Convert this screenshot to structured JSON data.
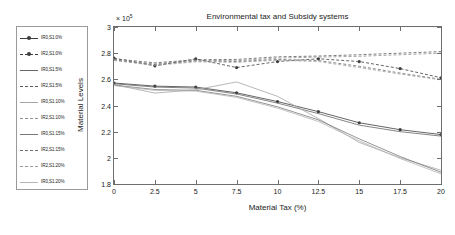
{
  "chart_data": {
    "type": "line",
    "title": "Environmental tax and Subsidy systems",
    "xlabel": "Material Tax (%)",
    "ylabel": "Material Levels",
    "y_exponent_label": "× 10",
    "y_exponent_power": "5",
    "xlim": [
      0,
      20
    ],
    "ylim": [
      1.8,
      3.0
    ],
    "xticks": [
      0,
      2.5,
      5,
      7.5,
      10,
      12.5,
      15,
      17.5,
      20
    ],
    "xticklabels": [
      "0",
      "2.5",
      "5",
      "7.5",
      "10",
      "12.5",
      "15",
      "17.5",
      "20"
    ],
    "yticks": [
      1.8,
      2.0,
      2.2,
      2.4,
      2.6,
      2.8,
      3.0
    ],
    "yticklabels": [
      "1.8",
      "2",
      "2.2",
      "2.4",
      "2.6",
      "2.8",
      "3"
    ],
    "grid": false,
    "legend_position": "outside-left",
    "x": [
      0,
      2.5,
      5,
      7.5,
      10,
      12.5,
      15,
      17.5,
      20
    ],
    "series": [
      {
        "name": "IR0,S1:0%",
        "label": "IR0,S1:0%",
        "style": "solid",
        "marker": "dot",
        "color": "#3d3d3d",
        "values": [
          2.572,
          2.548,
          2.541,
          2.497,
          2.43,
          2.353,
          2.268,
          2.215,
          2.178
        ]
      },
      {
        "name": "IR2,S1:0%",
        "label": "IR2,S1:0%",
        "style": "dashed",
        "marker": "dot",
        "color": "#3d3d3d",
        "values": [
          2.762,
          2.703,
          2.756,
          2.69,
          2.736,
          2.757,
          2.736,
          2.682,
          2.612
        ]
      },
      {
        "name": "IR0,S1:5%",
        "label": "IR0,S1:5%",
        "style": "solid",
        "marker": "none",
        "color": "#666666",
        "values": [
          2.566,
          2.541,
          2.533,
          2.488,
          2.418,
          2.338,
          2.25,
          2.2,
          2.166
        ]
      },
      {
        "name": "IR2,S1:5%",
        "label": "IR2,S1:5%",
        "style": "dashed",
        "marker": "none",
        "color": "#5a5a5a",
        "values": [
          2.757,
          2.726,
          2.75,
          2.752,
          2.772,
          2.778,
          2.788,
          2.8,
          2.812
        ]
      },
      {
        "name": "IR0,S1:10%",
        "label": "IR0,S1:10%",
        "style": "solid",
        "marker": "none",
        "color": "#a5a5a5",
        "values": [
          2.56,
          2.495,
          2.52,
          2.58,
          2.47,
          2.3,
          2.118,
          2.0,
          1.905
        ]
      },
      {
        "name": "IR2,S1:10%",
        "label": "IR2,S1:10%",
        "style": "dashed",
        "marker": "none",
        "color": "#8f8f8f",
        "values": [
          2.752,
          2.718,
          2.746,
          2.742,
          2.762,
          2.77,
          2.776,
          2.788,
          2.8
        ]
      },
      {
        "name": "IR0,S1:15%",
        "label": "IR0,S1:15%",
        "style": "solid",
        "marker": "none",
        "color": "#787878",
        "values": [
          2.556,
          2.522,
          2.516,
          2.47,
          2.39,
          2.29,
          2.145,
          2.01,
          1.89
        ]
      },
      {
        "name": "IR2,S1:15%",
        "label": "IR2,S1:15%",
        "style": "dashed",
        "marker": "none",
        "color": "#707070",
        "values": [
          2.748,
          2.712,
          2.74,
          2.736,
          2.752,
          2.744,
          2.7,
          2.648,
          2.6
        ]
      },
      {
        "name": "IR2,S1:20%",
        "label": "IR2,S1:20%",
        "style": "dashed",
        "marker": "none",
        "color": "#9c9c9c",
        "values": [
          2.744,
          2.706,
          2.734,
          2.73,
          2.746,
          2.736,
          2.69,
          2.64,
          2.596
        ]
      },
      {
        "name": "IR0,S1:20%",
        "label": "IR0,S1:20%",
        "style": "solid",
        "marker": "none",
        "color": "#b4b4b4",
        "values": [
          2.552,
          2.516,
          2.51,
          2.462,
          2.38,
          2.278,
          2.13,
          1.995,
          1.878
        ]
      }
    ]
  }
}
